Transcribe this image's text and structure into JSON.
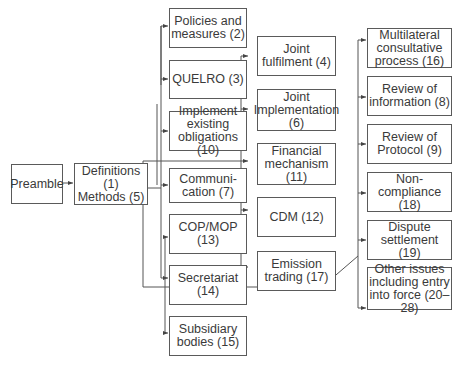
{
  "diagram": {
    "title": "",
    "nodes": {
      "preamble": "Preamble",
      "definitions": "Definitions (1)\nMethods (5)",
      "policies": "Policies and\nmeasures (2)",
      "quelro": "QUELRO (3)",
      "implement": "Implement\nexisting\nobligations (10)",
      "communication": "Communi-\ncation (7)",
      "copmop": "COP/MOP\n(13)",
      "secretariat": "Secretariat\n(14)",
      "subsidiary": "Subsidiary\nbodies (15)",
      "joint_fulfilment": "Joint\nfulfilment (4)",
      "joint_implementation": "Joint\nImplementation\n(6)",
      "financial": "Financial\nmechanism\n(11)",
      "cdm": "CDM (12)",
      "emission": "Emission\ntrading (17)",
      "multilateral": "Multilateral\nconsultative\nprocess (16)",
      "review_info": "Review of\ninformation (8)",
      "review_protocol": "Review of\nProtocol (9)",
      "noncompliance": "Non-compliance\n(18)",
      "dispute": "Dispute\nsettlement (19)",
      "other": "Other issues\nincluding entry\ninto force (20–28)"
    }
  }
}
